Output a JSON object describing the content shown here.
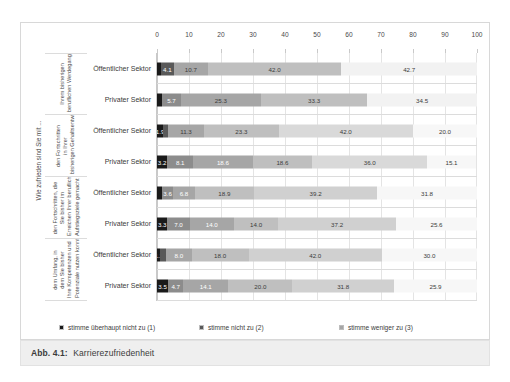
{
  "caption": {
    "prefix": "Abb. 4.1:",
    "title": "Karrierezufriedenheit"
  },
  "chart_data": {
    "type": "bar",
    "orientation": "horizontal",
    "stacked": true,
    "title": "",
    "xlabel": "",
    "ylabel": "",
    "xlim": [
      0,
      100
    ],
    "xticks": [
      "0",
      "10",
      "20",
      "30",
      "40",
      "50",
      "60",
      "70",
      "80",
      "90",
      "100"
    ],
    "grid": true,
    "legend_position": "bottom",
    "outer_group_label": "Wie zufrieden sind Sie mit ...",
    "legend": [
      {
        "label": "stimme überhaupt nicht zu (1)",
        "color": "#1a1a1a"
      },
      {
        "label": "stimme nicht zu (2)",
        "color": "#595959"
      },
      {
        "label": "stimme weniger zu (3)",
        "color": "#a6a6a6"
      },
      {
        "label": "stimme teilweise zu (4)",
        "color": "#bfbfbf"
      },
      {
        "label": "stimme überwiegend zu (5)",
        "color": "#d9d9d9"
      },
      {
        "label": "stimme voll und ganz zu (6)",
        "color": "#f2f2f2"
      }
    ],
    "series": [
      {
        "name": "stimme überhaupt nicht zu (1)",
        "values": [
          1.2,
          1.7,
          3.2,
          3.5,
          1.6,
          3.3,
          1.1,
          3.5
        ]
      },
      {
        "name": "stimme nicht zu (2)",
        "values": [
          4.1,
          5.7,
          1.9,
          8.1,
          3.6,
          7.0,
          1.8,
          4.7
        ]
      },
      {
        "name": "stimme weniger zu (3)",
        "values": [
          10.7,
          25.3,
          11.3,
          18.6,
          6.8,
          14.0,
          8.0,
          14.1
        ]
      },
      {
        "name": "stimme teilweise zu (4)",
        "values": [
          42.0,
          33.3,
          23.3,
          18.6,
          18.9,
          14.0,
          18.0,
          20.0
        ]
      },
      {
        "name": "stimme überwiegend zu (5)",
        "values": [
          42.7,
          34.5,
          42.0,
          36.0,
          39.2,
          37.2,
          42.0,
          31.8
        ]
      },
      {
        "name": "stimme voll und ganz zu (6)",
        "values": [
          0.0,
          0.0,
          20.0,
          15.1,
          31.8,
          25.6,
          30.0,
          25.9
        ]
      }
    ],
    "groups": [
      {
        "label": "Ihrem bisherigen beruflichen Werdegang?",
        "rows": [
          {
            "sector": "Öffentlicher Sektor",
            "segments": [
              {
                "value": 1.2,
                "display": "",
                "color": "#1a1a1a",
                "text_color": "#ffffff"
              },
              {
                "value": 4.1,
                "display": "4.1",
                "color": "#595959",
                "text_color": "#ffffff"
              },
              {
                "value": 10.7,
                "display": "10.7",
                "color": "#a6a6a6",
                "text_color": "#3b3b3b"
              },
              {
                "value": 42.0,
                "display": "42.0",
                "color": "#bfbfbf",
                "text_color": "#3b3b3b"
              },
              {
                "value": 42.7,
                "display": "42.7",
                "color": "#f2f2f2",
                "text_color": "#3b3b3b"
              }
            ]
          },
          {
            "sector": "Privater Sektor",
            "segments": [
              {
                "value": 1.7,
                "display": "",
                "color": "#1a1a1a",
                "text_color": "#ffffff"
              },
              {
                "value": 5.7,
                "display": "5.7",
                "color": "#8c8c8c",
                "text_color": "#ffffff"
              },
              {
                "value": 25.3,
                "display": "25.3",
                "color": "#a6a6a6",
                "text_color": "#3b3b3b"
              },
              {
                "value": 33.3,
                "display": "33.3",
                "color": "#bfbfbf",
                "text_color": "#3b3b3b"
              },
              {
                "value": 34.5,
                "display": "34.5",
                "color": "#f2f2f2",
                "text_color": "#3b3b3b"
              }
            ]
          }
        ]
      },
      {
        "label": "den Fortschritten in Ihrer bisherigen Gehaltsentwicklung?",
        "rows": [
          {
            "sector": "Öffentlicher Sektor",
            "segments": [
              {
                "value": 1.9,
                "display": "1.9",
                "color": "#1a1a1a",
                "text_color": "#ffffff"
              },
              {
                "value": 1.5,
                "display": "",
                "color": "#595959",
                "text_color": "#ffffff"
              },
              {
                "value": 11.3,
                "display": "11.3",
                "color": "#a6a6a6",
                "text_color": "#3b3b3b"
              },
              {
                "value": 23.3,
                "display": "23.3",
                "color": "#bfbfbf",
                "text_color": "#3b3b3b"
              },
              {
                "value": 42.0,
                "display": "42.0",
                "color": "#d9d9d9",
                "text_color": "#3b3b3b"
              },
              {
                "value": 20.0,
                "display": "20.0",
                "color": "#f7f7f7",
                "text_color": "#3b3b3b"
              }
            ]
          },
          {
            "sector": "Privater Sektor",
            "segments": [
              {
                "value": 3.2,
                "display": "3.2",
                "color": "#1a1a1a",
                "text_color": "#ffffff"
              },
              {
                "value": 8.1,
                "display": "8.1",
                "color": "#8c8c8c",
                "text_color": "#ffffff"
              },
              {
                "value": 18.6,
                "display": "18.6",
                "color": "#a6a6a6",
                "text_color": "#ffffff"
              },
              {
                "value": 18.6,
                "display": "18.6",
                "color": "#bfbfbf",
                "text_color": "#3b3b3b"
              },
              {
                "value": 36.0,
                "display": "36.0",
                "color": "#d9d9d9",
                "text_color": "#3b3b3b"
              },
              {
                "value": 15.1,
                "display": "15.1",
                "color": "#f7f7f7",
                "text_color": "#3b3b3b"
              }
            ]
          }
        ]
      },
      {
        "label": "den Fortschritten, die Sie bisher im Erreichen Ihrer beruflichen Aufstiegsziele gemacht haben?",
        "rows": [
          {
            "sector": "Öffentlicher Sektor",
            "segments": [
              {
                "value": 1.6,
                "display": "",
                "color": "#1a1a1a",
                "text_color": "#ffffff"
              },
              {
                "value": 3.6,
                "display": "3.6",
                "color": "#8c8c8c",
                "text_color": "#ffffff"
              },
              {
                "value": 6.8,
                "display": "6.8",
                "color": "#a6a6a6",
                "text_color": "#ffffff"
              },
              {
                "value": 18.9,
                "display": "18.9",
                "color": "#bfbfbf",
                "text_color": "#3b3b3b"
              },
              {
                "value": 39.2,
                "display": "39.2",
                "color": "#d0d0d0",
                "text_color": "#3b3b3b"
              },
              {
                "value": 31.8,
                "display": "31.8",
                "color": "#f7f7f7",
                "text_color": "#3b3b3b"
              }
            ]
          },
          {
            "sector": "Privater Sektor",
            "segments": [
              {
                "value": 3.3,
                "display": "3.3",
                "color": "#1a1a1a",
                "text_color": "#ffffff"
              },
              {
                "value": 7.0,
                "display": "7.0",
                "color": "#8c8c8c",
                "text_color": "#ffffff"
              },
              {
                "value": 14.0,
                "display": "14.0",
                "color": "#a6a6a6",
                "text_color": "#ffffff"
              },
              {
                "value": 14.0,
                "display": "14.0",
                "color": "#bfbfbf",
                "text_color": "#3b3b3b"
              },
              {
                "value": 37.2,
                "display": "37.2",
                "color": "#d0d0d0",
                "text_color": "#3b3b3b"
              },
              {
                "value": 25.6,
                "display": "25.6",
                "color": "#f7f7f7",
                "text_color": "#3b3b3b"
              }
            ]
          }
        ]
      },
      {
        "label": "dem Umfang, in dem Sie bisher Ihre Kompetenzen und Potenziale nutzen konnten?",
        "rows": [
          {
            "sector": "Öffentlicher Sektor",
            "segments": [
              {
                "value": 1.1,
                "display": "1.1",
                "color": "#1a1a1a",
                "text_color": "#ffffff"
              },
              {
                "value": 1.8,
                "display": "",
                "color": "#595959",
                "text_color": "#ffffff"
              },
              {
                "value": 8.0,
                "display": "8.0",
                "color": "#a6a6a6",
                "text_color": "#ffffff"
              },
              {
                "value": 18.0,
                "display": "18.0",
                "color": "#bfbfbf",
                "text_color": "#3b3b3b"
              },
              {
                "value": 42.0,
                "display": "42.0",
                "color": "#d0d0d0",
                "text_color": "#3b3b3b"
              },
              {
                "value": 30.0,
                "display": "30.0",
                "color": "#f7f7f7",
                "text_color": "#3b3b3b"
              }
            ]
          },
          {
            "sector": "Privater Sektor",
            "segments": [
              {
                "value": 3.5,
                "display": "3.5",
                "color": "#1a1a1a",
                "text_color": "#ffffff"
              },
              {
                "value": 4.7,
                "display": "4.7",
                "color": "#8c8c8c",
                "text_color": "#ffffff"
              },
              {
                "value": 14.1,
                "display": "14.1",
                "color": "#a6a6a6",
                "text_color": "#ffffff"
              },
              {
                "value": 20.0,
                "display": "20.0",
                "color": "#bfbfbf",
                "text_color": "#3b3b3b"
              },
              {
                "value": 31.8,
                "display": "31.8",
                "color": "#d0d0d0",
                "text_color": "#3b3b3b"
              },
              {
                "value": 25.9,
                "display": "25.9",
                "color": "#f7f7f7",
                "text_color": "#3b3b3b"
              }
            ]
          }
        ]
      }
    ]
  }
}
